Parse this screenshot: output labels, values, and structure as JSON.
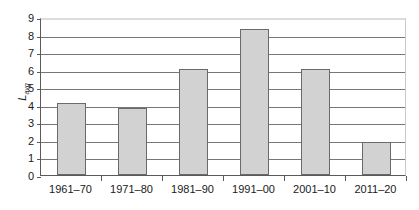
{
  "chart_data": {
    "type": "bar",
    "title": "",
    "xlabel": "",
    "ylabel": "L_avg",
    "ylabel_base": "L",
    "ylabel_sub": "avg",
    "categories": [
      "1961–70",
      "1971–80",
      "1981–90",
      "1991–00",
      "2001–10",
      "2011–20"
    ],
    "values": [
      4.1,
      3.8,
      6.05,
      8.3,
      6.05,
      1.9
    ],
    "ylim": [
      0,
      9
    ],
    "ytick_labels": [
      "0",
      "1",
      "2",
      "3",
      "4",
      "5",
      "6",
      "7",
      "8",
      "9"
    ],
    "ytick_values": [
      0,
      1,
      2,
      3,
      4,
      5,
      6,
      7,
      8,
      9
    ],
    "grid": true,
    "legend": false,
    "bar_fill_color": "#d2d2d2",
    "bar_border_color": "#6a6a6a",
    "gridline_color": "#777777",
    "axis_color": "#5a5a5a",
    "background_color": "#ffffff"
  }
}
